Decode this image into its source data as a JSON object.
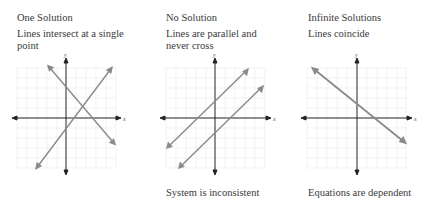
{
  "panels": [
    {
      "title": "One Solution",
      "description": "Lines intersect at a single point",
      "caption": "",
      "x_label": "x",
      "y_label": "y"
    },
    {
      "title": "No Solution",
      "description": "Lines are parallel and never cross",
      "caption": "System is inconsistent",
      "x_label": "x",
      "y_label": "y"
    },
    {
      "title": "Infinite Solutions",
      "description": "Lines coincide",
      "caption": "Equations are dependent",
      "x_label": "x",
      "y_label": "y"
    }
  ],
  "colors": {
    "text": "#3a3a3a",
    "axis": "#222222",
    "line": "#8a8a8a",
    "grid": "#ececec"
  }
}
